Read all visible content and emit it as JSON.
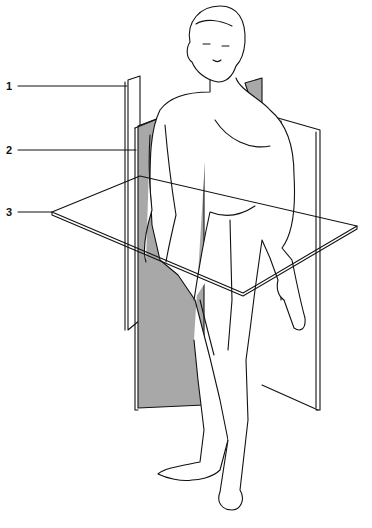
{
  "figure": {
    "labels": [
      {
        "id": "1",
        "text": "1",
        "x": 6,
        "y": 81
      },
      {
        "id": "2",
        "text": "2",
        "x": 6,
        "y": 145
      },
      {
        "id": "3",
        "text": "3",
        "x": 6,
        "y": 207
      }
    ],
    "colors": {
      "plane_shade": "#a8a8a8",
      "line": "#111111",
      "background": "#ffffff"
    }
  }
}
